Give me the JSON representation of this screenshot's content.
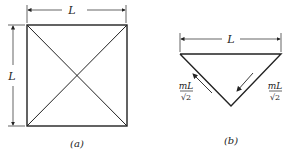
{
  "figure_a": {
    "label": "(a)",
    "top_dimension": "L",
    "side_dimension": "L"
  },
  "figure_b": {
    "label": "(b)",
    "top_dimension": "L",
    "left_force_num": "mL",
    "left_force_den": "√2",
    "right_force_num": "mL",
    "right_force_den": "√2"
  },
  "colors": {
    "line": "#222222",
    "background": "#ffffff"
  }
}
